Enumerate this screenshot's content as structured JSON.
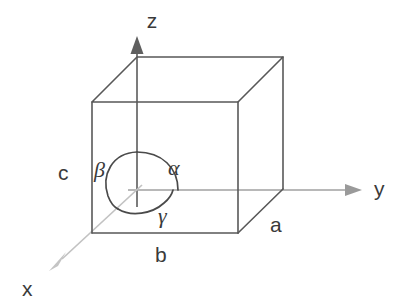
{
  "figure": {
    "background_color": "#ffffff",
    "line_color": "#585858",
    "axis_color_y": "#a0a0a0",
    "axis_color_z": "#6e6e6e",
    "axis_color_x": "#c2c2c2",
    "label_color": "#3a3a3a"
  },
  "axes": [
    {
      "id": "z",
      "label": "z",
      "direction": "up",
      "label_x": 152,
      "label_y": 28
    },
    {
      "id": "y",
      "label": "y",
      "direction": "right",
      "label_x": 374,
      "label_y": 196
    },
    {
      "id": "x",
      "label": "x",
      "direction": "down-left",
      "label_x": 22,
      "label_y": 296
    }
  ],
  "edge_labels": [
    {
      "id": "a",
      "label": "a",
      "edge": "right-depth-edge",
      "x": 270,
      "y": 232
    },
    {
      "id": "b",
      "label": "b",
      "edge": "bottom-front-edge",
      "x": 155,
      "y": 262
    },
    {
      "id": "c",
      "label": "c",
      "edge": "left-vertical-edge",
      "x": 58,
      "y": 180
    }
  ],
  "angle_labels": [
    {
      "id": "alpha",
      "label": "α",
      "between": "b-and-c",
      "x": 168,
      "y": 175
    },
    {
      "id": "beta",
      "label": "β",
      "between": "a-and-c",
      "x": 94,
      "y": 177
    },
    {
      "id": "gamma",
      "label": "γ",
      "between": "a-and-b",
      "x": 158,
      "y": 223
    }
  ],
  "geometry": {
    "origin": {
      "x": 137,
      "y": 190
    },
    "vertices": {
      "top_back_left": {
        "x": 137,
        "y": 57
      },
      "top_back_right": {
        "x": 283,
        "y": 57
      },
      "top_front_left": {
        "x": 92,
        "y": 102
      },
      "top_front_right": {
        "x": 238,
        "y": 102
      },
      "bottom_back_right": {
        "x": 283,
        "y": 189
      },
      "bottom_front_left": {
        "x": 92,
        "y": 233
      },
      "bottom_front_right": {
        "x": 238,
        "y": 233
      }
    },
    "arrow_tips": {
      "z": {
        "x": 137,
        "y": 37
      },
      "y": {
        "x": 361,
        "y": 190
      },
      "x": {
        "x": 50,
        "y": 270
      }
    }
  }
}
